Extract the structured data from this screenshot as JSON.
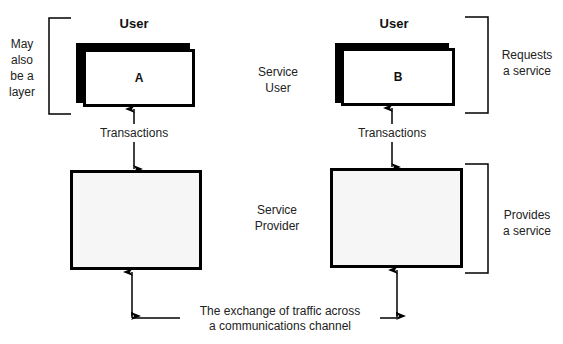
{
  "diagram": {
    "left": {
      "user_title": "User",
      "box_label": "A",
      "bracket_note_lines": [
        "May",
        "also",
        "be a",
        "layer"
      ],
      "transactions_label": "Transactions"
    },
    "right": {
      "user_title": "User",
      "box_label": "B",
      "requests_lines": [
        "Requests",
        "a service"
      ],
      "provides_lines": [
        "Provides",
        "a service"
      ],
      "transactions_label": "Transactions"
    },
    "center": {
      "service_user_lines": [
        "Service",
        "User"
      ],
      "service_provider_lines": [
        "Service",
        "Provider"
      ]
    },
    "channel": {
      "lines": [
        "The exchange of traffic across",
        "a communications channel"
      ]
    }
  }
}
